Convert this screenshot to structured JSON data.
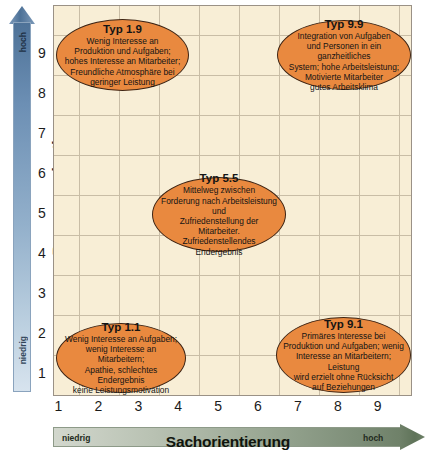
{
  "chart_data": {
    "type": "scatter",
    "xlabel": "Sachorientierung",
    "ylabel": "Personenorientierung",
    "xlim": [
      0,
      9.5
    ],
    "ylim": [
      0,
      9.5
    ],
    "xticks": [
      "1",
      "2",
      "3",
      "4",
      "5",
      "6",
      "7",
      "8",
      "9"
    ],
    "yticks": [
      "9",
      "8",
      "7",
      "6",
      "5",
      "4",
      "3",
      "2",
      "1"
    ],
    "grid": true,
    "legend": null,
    "x_low_label": "niedrig",
    "x_high_label": "hoch",
    "y_low_label": "niedrig",
    "y_high_label": "hoch",
    "colors": {
      "bubble_fill": "#e9893f",
      "bubble_border": "#3d2414",
      "plot_background": "#f8eed6",
      "gridline": "#c9bda6",
      "y_axis_arrow_dark": "#4e7298",
      "y_axis_arrow_light": "#d7e3ee",
      "x_axis_arrow_light": "#d2d7cd",
      "x_axis_arrow_dark": "#6f8169"
    },
    "points": [
      {
        "id": "typ-1-9",
        "x": 1,
        "y": 9,
        "title": "Typ 1.9",
        "body": "Wenig Interesse an\nProduktion und Aufgaben;\nhohes Interesse an Mitarbeiter;\nFreundliche Atmosphäre bei\ngeringer Leistung"
      },
      {
        "id": "typ-9-9",
        "x": 9,
        "y": 9,
        "title": "Typ 9.9",
        "body": "Integration von Aufgaben\nund Personen in ein ganzheitliches\nSystem; hohe Arbeitsleistung;\nMotivierte Mitarbeiter\ngutes Arbeitsklima"
      },
      {
        "id": "typ-5-5",
        "x": 5,
        "y": 5,
        "title": "Typ 5.5",
        "body": "Mittelweg zwischen\nForderung nach Arbeitsleistung und\nZufriedenstellung der Mitarbeiter.\nZufriedenstellendes\nEndergebnis"
      },
      {
        "id": "typ-1-1",
        "x": 1,
        "y": 1,
        "title": "Typ 1.1",
        "body": "Wenig Interesse an Aufgaben;\nwenig Interesse an Mitarbeitern;\nApathie, schlechtes Endergebnis\nkeine Leistungsmotivation"
      },
      {
        "id": "typ-9-1",
        "x": 9,
        "y": 1,
        "title": "Typ 9.1",
        "body": "Primäres Interesse bei\nProduktion und Aufgaben; wenig\nInteresse an Mitarbeitern; Leistung\nwird erzielt ohne Rücksicht\nauf Beziehungen"
      }
    ]
  },
  "axes": {
    "y": {
      "title": "Personenorientierung",
      "high": "hoch",
      "low": "niedrig",
      "ticks": [
        "9",
        "8",
        "7",
        "6",
        "5",
        "4",
        "3",
        "2",
        "1"
      ]
    },
    "x": {
      "title": "Sachorientierung",
      "high": "hoch",
      "low": "niedrig",
      "ticks": [
        "1",
        "2",
        "3",
        "4",
        "5",
        "6",
        "7",
        "8",
        "9"
      ]
    }
  }
}
